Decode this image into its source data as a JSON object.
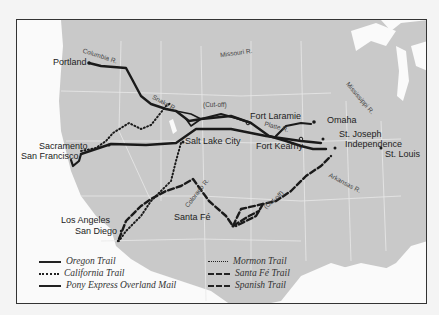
{
  "map": {
    "cities": {
      "portland": "Portland",
      "sacramento": "Sacramento",
      "san_francisco": "San Francisco",
      "salt_lake_city": "Salt Lake City",
      "fort_laramie": "Fort Laramie",
      "fort_kearny": "Fort Kearny",
      "omaha": "Omaha",
      "st_joseph": "St. Joseph",
      "independence": "Independence",
      "st_louis": "St. Louis",
      "los_angeles": "Los Angeles",
      "san_diego": "San Diego",
      "santa_fe": "Santa Fé"
    },
    "rivers": {
      "columbia": "Columbia R.",
      "snake": "Snake R.",
      "missouri": "Missouri R.",
      "mississippi": "Mississippi R.",
      "platte": "Platte R.",
      "colorado": "Colorado R.",
      "arkansas": "Arkansas R."
    },
    "annotations": {
      "cutoff_north": "(Cut-off)",
      "cutoff_south": "(Cut-off)"
    },
    "colors": {
      "land": "#c9c9c9",
      "water": "#fafafa",
      "borders": "#e8e8e8",
      "trails": "#1a1a1a",
      "frame": "#333333"
    }
  },
  "legend": {
    "items": [
      {
        "label": "Oregon Trail",
        "style": "solid"
      },
      {
        "label": "California Trail",
        "style": "dotted"
      },
      {
        "label": "Pony Express Overland Mail",
        "style": "solid"
      },
      {
        "label": "Mormon Trail",
        "style": "dotted"
      },
      {
        "label": "Santa Fé Trail",
        "style": "dashed"
      },
      {
        "label": "Spanish Trail",
        "style": "dashed"
      }
    ]
  }
}
